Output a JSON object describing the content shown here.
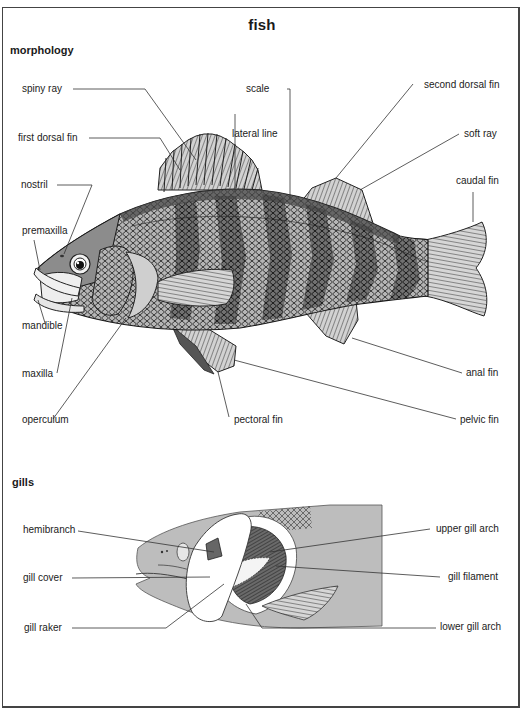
{
  "title": "fish",
  "sections": {
    "morphology": {
      "heading": "morphology",
      "labels": {
        "spiny_ray": "spiny ray",
        "scale": "scale",
        "second_dorsal_fin": "second dorsal fin",
        "first_dorsal_fin": "first dorsal fin",
        "lateral_line": "lateral line",
        "soft_ray": "soft ray",
        "nostril": "nostril",
        "caudal_fin": "caudal fin",
        "premaxilla": "premaxilla",
        "mandible": "mandible",
        "maxilla": "maxilla",
        "anal_fin": "anal fin",
        "operculum": "operculum",
        "pectoral_fin": "pectoral fin",
        "pelvic_fin": "pelvic fin"
      }
    },
    "gills": {
      "heading": "gills",
      "labels": {
        "hemibranch": "hemibranch",
        "upper_gill_arch": "upper gill arch",
        "gill_cover": "gill cover",
        "gill_filament": "gill filament",
        "gill_raker": "gill raker",
        "lower_gill_arch": "lower gill arch"
      }
    }
  },
  "colors": {
    "frame": "#444444",
    "fish_body": "#8a8a8a",
    "fish_dark_band": "#555555",
    "fin_fill": "#c8c8c8",
    "gill_head_fill": "#bdbdbd",
    "leader_line": "#333333"
  }
}
